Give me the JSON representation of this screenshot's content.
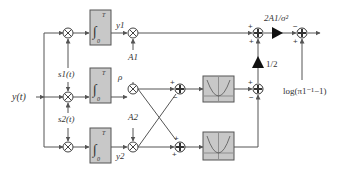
{
  "diagram": {
    "type": "block-diagram",
    "input_label": "y(t)",
    "reference_signals": [
      "s1(t)",
      "s2(t)"
    ],
    "integrator": {
      "lower_limit": "0",
      "upper_limit": "T",
      "symbol": "∫"
    },
    "integrator_outputs": [
      "y1",
      "ρ",
      "y2"
    ],
    "amplitudes": [
      "A1",
      "A2"
    ],
    "gains": {
      "top": "2A1/σ²",
      "half": "1/2"
    },
    "bias_label": "log(π1⁻¹−1)",
    "signs": {
      "top_sum": [
        "+",
        "+"
      ],
      "middle_sum": [
        "+",
        "−"
      ],
      "lower_sum": [
        "+",
        "+"
      ],
      "square_diff": [
        "+",
        "−"
      ],
      "output_sum": [
        "−",
        "+"
      ]
    },
    "colors": {
      "line": "#555555",
      "block_fill": "#c8c8c8",
      "block_stroke": "#555555",
      "gain_fill": "#111111"
    }
  }
}
